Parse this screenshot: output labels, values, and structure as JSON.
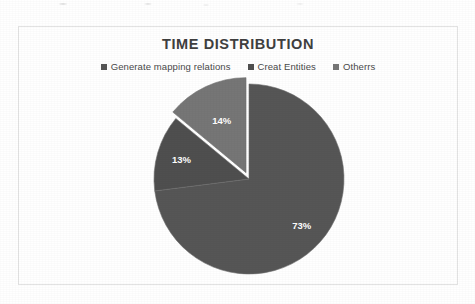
{
  "figure": {
    "background_color": "#ffffff",
    "frame_border_color": "#e3e3e3"
  },
  "chart_data": {
    "type": "pie",
    "title": "TIME DISTRIBUTION",
    "xlabel": "",
    "ylabel": "",
    "legend_position": "top",
    "grid": false,
    "categories": [
      "Generate mapping relations",
      "Creat Entities",
      "Otherrs"
    ],
    "values": [
      73,
      13,
      14
    ],
    "value_labels": [
      "73%",
      "13%",
      "14%"
    ],
    "colors": [
      "#565656",
      "#4f4f4f",
      "#767676"
    ],
    "label_color": "#ffffff",
    "start_angle_deg": 0,
    "direction": "clockwise",
    "slices": [
      {
        "name": "Generate mapping relations",
        "value": 73,
        "label": "73%",
        "color": "#565656",
        "start_deg": 0,
        "end_deg": 262.8,
        "exploded": false
      },
      {
        "name": "Creat Entities",
        "value": 13,
        "label": "13%",
        "color": "#4f4f4f",
        "start_deg": 262.8,
        "end_deg": 309.6,
        "exploded": false
      },
      {
        "name": "Otherrs",
        "value": 14,
        "label": "14%",
        "color": "#767676",
        "start_deg": 309.6,
        "end_deg": 360,
        "exploded": true
      }
    ]
  },
  "legend": {
    "items": [
      {
        "label": "Generate mapping relations",
        "swatch_color": "#565656"
      },
      {
        "label": "Creat Entities",
        "swatch_color": "#4f4f4f"
      },
      {
        "label": "Otherrs",
        "swatch_color": "#767676"
      }
    ]
  }
}
